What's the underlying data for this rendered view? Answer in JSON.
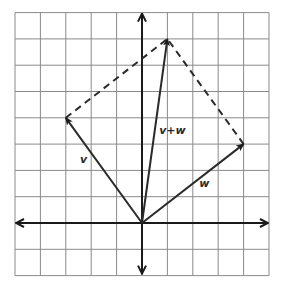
{
  "diagram": {
    "type": "vector-addition-parallelogram",
    "grid": {
      "x_range": [
        -5,
        5
      ],
      "y_range": [
        -2,
        8
      ],
      "origin_px": [
        142,
        223
      ],
      "unit_px": [
        25.4,
        26.3
      ],
      "grid_color": "#8a8a8a",
      "axis_color": "#1a1a1a"
    },
    "vectors": [
      {
        "id": "v",
        "label": "v",
        "from": [
          0,
          0
        ],
        "to": [
          -3,
          4
        ],
        "label_pos": [
          -2.3,
          2.3
        ]
      },
      {
        "id": "w",
        "label": "w",
        "from": [
          0,
          0
        ],
        "to": [
          4,
          3
        ],
        "label_pos": [
          2.45,
          1.35
        ]
      },
      {
        "id": "vw",
        "label": "v+w",
        "from": [
          0,
          0
        ],
        "to": [
          1,
          7
        ],
        "label_pos": [
          1.2,
          3.4
        ]
      }
    ],
    "dashed_edges": [
      {
        "from": [
          -3,
          4
        ],
        "to": [
          1,
          7
        ]
      },
      {
        "from": [
          4,
          3
        ],
        "to": [
          1,
          7
        ]
      }
    ],
    "colors": {
      "vector": "#2a2a2a",
      "dashed": "#2a2a2a"
    }
  }
}
